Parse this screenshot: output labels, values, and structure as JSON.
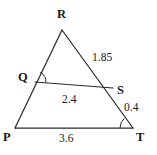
{
  "figure": {
    "kind": "geometry-diagram",
    "shape": "triangle-with-transversal",
    "width": 157,
    "height": 155,
    "background_color": "#ffffff",
    "stroke_color": "#2b2b2b"
  },
  "vertices": [
    {
      "name": "R",
      "label": "R",
      "x": 62,
      "y": 30,
      "label_x": 57,
      "label_y": 8
    },
    {
      "name": "Q",
      "label": "Q",
      "x": 35,
      "y": 82,
      "label_x": 18,
      "label_y": 71
    },
    {
      "name": "S",
      "label": "S",
      "x": 113,
      "y": 88,
      "label_x": 117,
      "label_y": 84
    },
    {
      "name": "P",
      "label": "P",
      "x": 15,
      "y": 128,
      "label_x": 3,
      "label_y": 131
    },
    {
      "name": "T",
      "label": "T",
      "x": 133,
      "y": 128,
      "label_x": 136,
      "label_y": 131
    }
  ],
  "segments": [
    {
      "name": "RP",
      "from": "R",
      "to": "P",
      "measure": null
    },
    {
      "name": "RT",
      "from": "R",
      "to": "T",
      "measure": "1.85"
    },
    {
      "name": "PT",
      "from": "P",
      "to": "T",
      "measure": "3.6"
    },
    {
      "name": "QS",
      "from": "Q",
      "to": "S",
      "measure": "2.4"
    },
    {
      "name": "ST",
      "from": "S",
      "to": "T",
      "measure": "0.4"
    }
  ],
  "measures": [
    {
      "name": "RS-measure",
      "value": "1.85",
      "x": 92,
      "y": 52
    },
    {
      "name": "QS-measure",
      "value": "2.4",
      "x": 62,
      "y": 94
    },
    {
      "name": "ST-measure",
      "value": "0.4",
      "x": 124,
      "y": 102
    },
    {
      "name": "PT-measure",
      "value": "3.6",
      "x": 59,
      "y": 133
    }
  ],
  "angle_marks": [
    {
      "name": "angle-at-Q",
      "vertex": "Q",
      "radius": 11
    },
    {
      "name": "angle-at-T",
      "vertex": "T",
      "radius": 13
    }
  ]
}
